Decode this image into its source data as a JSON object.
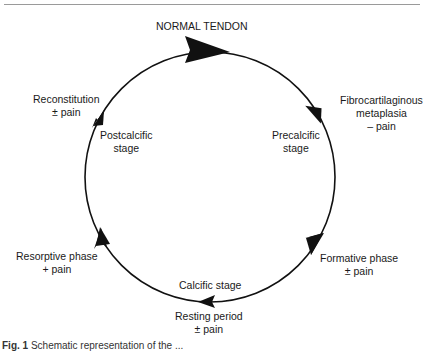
{
  "diagram": {
    "title": "NORMAL TENDON",
    "type": "cycle",
    "direction": "clockwise",
    "outer_labels": [
      {
        "id": "fibrocartilaginous",
        "lines": [
          "Fibrocartilaginous",
          "metaplasia",
          "– pain"
        ]
      },
      {
        "id": "formative",
        "lines": [
          "Formative phase",
          "± pain"
        ]
      },
      {
        "id": "resting",
        "lines": [
          "Resting period",
          "± pain"
        ]
      },
      {
        "id": "resorptive",
        "lines": [
          "Resorptive phase",
          "+ pain"
        ]
      },
      {
        "id": "reconstitution",
        "lines": [
          "Reconstitution",
          "± pain"
        ]
      }
    ],
    "inner_labels": [
      {
        "id": "precalcific",
        "lines": [
          "Precalcific",
          "stage"
        ]
      },
      {
        "id": "calcific",
        "lines": [
          "Calcific stage"
        ]
      },
      {
        "id": "postcalcific",
        "lines": [
          "Postcalcific",
          "stage"
        ]
      }
    ]
  },
  "caption": {
    "label": "Fig. 1",
    "text": "Schematic representation of the ..."
  }
}
